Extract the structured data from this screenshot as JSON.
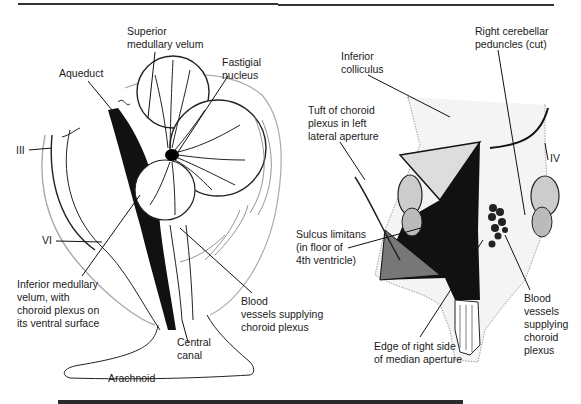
{
  "figure": {
    "left_panel": {
      "description": "Midsagittal section of brainstem and cerebellum",
      "labels": {
        "superior_medullary_velum": [
          "Superior",
          "medullary velum"
        ],
        "fastigial_nucleus": [
          "Fastigial",
          "nucleus"
        ],
        "aqueduct": [
          "Aqueduct"
        ],
        "cranial_nerve_III": [
          "III"
        ],
        "cranial_nerve_VI": [
          "VI"
        ],
        "inferior_medullary_velum": [
          "Inferior medullary",
          "velum, with",
          "choroid plexus on",
          "its ventral surface"
        ],
        "blood_vessels": [
          "Blood",
          "vessels supplying",
          "choroid plexus"
        ],
        "central_canal": [
          "Central",
          "canal"
        ],
        "arachnoid": [
          "Arachnoid"
        ]
      }
    },
    "right_panel": {
      "description": "Dorsal view of brainstem with cerebellum removed, showing 4th ventricle floor",
      "labels": {
        "inferior_colliculus": [
          "Inferior",
          "colliculus"
        ],
        "right_cerebellar_peduncles": [
          "Right cerebellar",
          "peduncles (cut)"
        ],
        "tuft_of_choroid_plexus": [
          "Tuft of choroid",
          "plexus in left",
          "lateral aperture"
        ],
        "cranial_nerve_IV": [
          "IV"
        ],
        "sulcus_limitans": [
          "Sulcus limitans",
          "(in floor of",
          "4th ventricle)"
        ],
        "blood_vessels": [
          "Blood",
          "vessels",
          "supplying",
          "choroid",
          "plexus"
        ],
        "median_aperture_edge": [
          "Edge of right side",
          "of median aperture"
        ]
      }
    }
  }
}
